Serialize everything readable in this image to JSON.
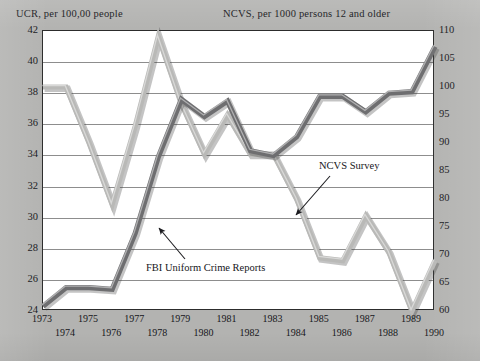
{
  "chart_data": {
    "type": "line",
    "title": "",
    "xlabel": "",
    "left_axis_title": "UCR, per 100,00 people",
    "right_axis_title": "NCVS, per 1000 persons 12 and older",
    "ylabel": "UCR, per 100,00 people",
    "y2label": "NCVS, per 1000 persons 12 and older",
    "grid": true,
    "legend_position": "annotations-on-plot",
    "x": [
      1973,
      1974,
      1975,
      1976,
      1977,
      1978,
      1979,
      1980,
      1981,
      1982,
      1983,
      1984,
      1985,
      1986,
      1987,
      1988,
      1989,
      1990
    ],
    "categories": [
      "1973",
      "1974",
      "1975",
      "1976",
      "1977",
      "1978",
      "1979",
      "1980",
      "1981",
      "1982",
      "1983",
      "1984",
      "1985",
      "1986",
      "1987",
      "1988",
      "1989",
      "1990"
    ],
    "ylim": [
      24,
      42
    ],
    "yticks": [
      24,
      26,
      28,
      30,
      32,
      34,
      36,
      38,
      40,
      42
    ],
    "y2lim": [
      60,
      110
    ],
    "y2ticks": [
      60,
      65,
      70,
      75,
      80,
      85,
      90,
      95,
      100,
      105,
      110
    ],
    "series": [
      {
        "name": "FBI Uniform Crime Reports",
        "axis": "left",
        "color": "#6e6e70",
        "values": [
          24.3,
          25.5,
          25.5,
          25.4,
          29.0,
          33.9,
          37.6,
          36.5,
          37.5,
          34.3,
          34.0,
          35.2,
          37.8,
          37.8,
          36.8,
          38.0,
          38.1,
          41.0
        ]
      },
      {
        "name": "NCVS Survey",
        "axis": "right",
        "color": "#b9b9b7",
        "values": [
          100.0,
          100.0,
          90.0,
          79.0,
          93.0,
          109.0,
          97.0,
          88.0,
          95.0,
          88.0,
          88.0,
          80.0,
          69.5,
          69.0,
          77.0,
          70.5,
          60.0,
          69.0
        ]
      }
    ],
    "annotations": [
      {
        "text": "NCVS Survey",
        "target_series": "NCVS Survey"
      },
      {
        "text": "FBI Uniform Crime Reports",
        "target_series": "FBI Uniform Crime Reports"
      }
    ]
  },
  "axes": {
    "left_title": "UCR, per 100,00 people",
    "right_title": "NCVS, per 1000 persons 12 and older",
    "left_ticks": [
      "42",
      "40",
      "38",
      "36",
      "34",
      "32",
      "30",
      "28",
      "26",
      "24"
    ],
    "right_ticks": [
      "110",
      "105",
      "100",
      "95",
      "90",
      "85",
      "80",
      "75",
      "70",
      "65",
      "60"
    ],
    "x_ticks_top_row": [
      "1973",
      "1975",
      "1977",
      "1979",
      "1981",
      "1983",
      "1985",
      "1987",
      "1989"
    ],
    "x_ticks_bottom_row": [
      "1974",
      "1976",
      "1978",
      "1980",
      "1982",
      "1984",
      "1986",
      "1988",
      "1990"
    ]
  },
  "annotations": {
    "ncvs": "NCVS Survey",
    "fbi": "FBI Uniform Crime Reports"
  },
  "colors": {
    "background": "#b3b3b1",
    "plot_background": "#ffffff",
    "gridline": "#8d8d8d",
    "frame": "#2c2c2c",
    "ucr_line": "#6e6e70",
    "ncvs_line": "#b9b9b7",
    "text": "#16161a"
  }
}
